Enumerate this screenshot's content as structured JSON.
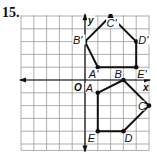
{
  "problem_number": "15.",
  "graph": {
    "x_axis_label": "x",
    "y_axis_label": "y",
    "origin_label": "O",
    "grid": {
      "x_min": -5,
      "x_max": 5,
      "y_min": -5,
      "y_max": 5
    }
  },
  "figures": [
    {
      "name": "pentagon-image",
      "vertices": [
        {
          "label": "A'",
          "x": 1,
          "y": 1
        },
        {
          "label": "B'",
          "x": 0,
          "y": 3
        },
        {
          "label": "C'",
          "x": 2,
          "y": 5
        },
        {
          "label": "D'",
          "x": 4,
          "y": 3
        },
        {
          "label": "E'",
          "x": 4,
          "y": 1
        }
      ]
    },
    {
      "name": "pentagon-preimage",
      "vertices": [
        {
          "label": "A",
          "x": 1,
          "y": -1
        },
        {
          "label": "B",
          "x": 3,
          "y": 0
        },
        {
          "label": "C",
          "x": 5,
          "y": -2
        },
        {
          "label": "D",
          "x": 3,
          "y": -4
        },
        {
          "label": "E",
          "x": 1,
          "y": -4
        }
      ]
    }
  ],
  "colors": {
    "grid": "#9a9a9a",
    "axis": "#111111",
    "figure": "#111111"
  }
}
